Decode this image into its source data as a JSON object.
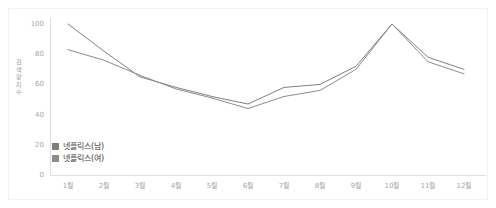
{
  "chart_data": {
    "type": "line",
    "title": "",
    "xlabel": "",
    "ylabel": "검색량 지수",
    "categories": [
      "1월",
      "2월",
      "3월",
      "4월",
      "5월",
      "6월",
      "7월",
      "8월",
      "9월",
      "10월",
      "11월",
      "12월"
    ],
    "series": [
      {
        "name": "넷플릭스(남)",
        "color": "#7f7f7f",
        "values": [
          100,
          82,
          65,
          58,
          52,
          47,
          58,
          60,
          72,
          100,
          78,
          70
        ]
      },
      {
        "name": "넷플릭스(여)",
        "color": "#8c8c8c",
        "values": [
          83,
          76,
          66,
          57,
          51,
          44,
          52,
          56,
          70,
          100,
          75,
          67
        ]
      }
    ],
    "ylim": [
      0,
      100
    ],
    "yticks": [
      0,
      20,
      40,
      60,
      80,
      100
    ],
    "ytick_labels": [
      "0",
      "20",
      "40",
      "60",
      "80",
      "100"
    ],
    "grid": false,
    "legend_position": "inside-lower-left"
  },
  "axis": {
    "y_label_chars": "검\n색\n량\n지\n수"
  }
}
